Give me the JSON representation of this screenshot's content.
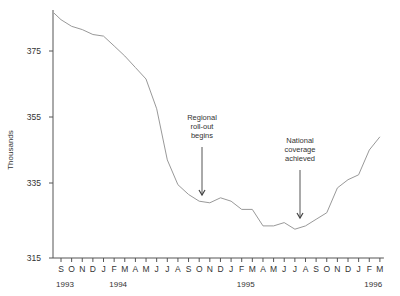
{
  "chart_data": {
    "type": "line",
    "title": "",
    "xlabel": "",
    "ylabel": "Thousands",
    "ylim": [
      315,
      389
    ],
    "yticks": [
      315,
      335,
      355,
      375
    ],
    "grid": false,
    "legend": null,
    "x": [
      "Aug 93",
      "Sep 93",
      "Oct 93",
      "Nov 93",
      "Dec 93",
      "Jan 94",
      "Feb 94",
      "Mar 94",
      "Apr 94",
      "May 94",
      "Jun 94",
      "Jul 94",
      "Aug 94",
      "Sep 94",
      "Oct 94",
      "Nov 94",
      "Dec 94",
      "Jan 95",
      "Feb 95",
      "Mar 95",
      "Apr 95",
      "May 95",
      "Jun 95",
      "Jul 95",
      "Aug 95",
      "Sep 95",
      "Oct 95",
      "Nov 95",
      "Dec 95",
      "Jan 96",
      "Feb 96",
      "Mar 96"
    ],
    "series": [
      {
        "name": "Thousands",
        "values": [
          386.5,
          384.5,
          382.5,
          381.5,
          380,
          379.5,
          376.5,
          373.5,
          370,
          366.5,
          357.5,
          342,
          334.5,
          331.5,
          329.5,
          329,
          330.5,
          329.5,
          327,
          327,
          322,
          322,
          323,
          321,
          322,
          324,
          326,
          333.5,
          336,
          337.5,
          345,
          349
        ],
        "color": "#999999"
      }
    ],
    "xtick_labels": [
      "S",
      "O",
      "N",
      "D",
      "J",
      "F",
      "M",
      "A",
      "M",
      "J",
      "J",
      "A",
      "S",
      "O",
      "N",
      "D",
      "J",
      "F",
      "M",
      "A",
      "M",
      "J",
      "J",
      "A",
      "S",
      "O",
      "N",
      "D",
      "J",
      "F",
      "M"
    ],
    "year_labels": [
      {
        "label": "1993",
        "month_index": 0
      },
      {
        "label": "1994",
        "month_index": 5
      },
      {
        "label": "1995",
        "month_index": 17
      },
      {
        "label": "1996",
        "month_index": 29
      }
    ],
    "annotations": [
      {
        "lines": [
          "Regional",
          "roll-out",
          "begins"
        ],
        "month_index": 13
      },
      {
        "lines": [
          "National",
          "coverage",
          "achieved"
        ],
        "month_index": 22
      }
    ]
  },
  "layout": {
    "axis_x": 53,
    "first_tick_x": 61,
    "month_spacing": 10.63,
    "y_ref_value": 375,
    "y_ref_px": 51,
    "px_per_unit": 3.3,
    "baseline_y": 258
  }
}
